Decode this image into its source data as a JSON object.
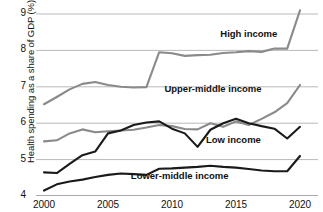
{
  "chart_data": {
    "type": "line",
    "title": "",
    "xlabel": "",
    "ylabel": "Health spending as a share of GDP (%)",
    "xlim": [
      2000,
      2020
    ],
    "ylim": [
      4,
      9
    ],
    "grid": true,
    "legend_position": "inline-labels",
    "x": [
      2000,
      2001,
      2002,
      2003,
      2004,
      2005,
      2006,
      2007,
      2008,
      2009,
      2010,
      2011,
      2012,
      2013,
      2014,
      2015,
      2016,
      2017,
      2018,
      2019,
      2020
    ],
    "xticks": [
      "2000",
      "2005",
      "2010",
      "2015",
      "2020"
    ],
    "yticks": [
      "4",
      "5",
      "6",
      "7",
      "8",
      "9"
    ],
    "series": [
      {
        "name": "High income",
        "color": "#8a8a8a",
        "label_x": 2016.0,
        "label_y": 8.45,
        "values": [
          6.52,
          6.72,
          6.93,
          7.08,
          7.13,
          7.05,
          7.0,
          6.98,
          6.99,
          7.95,
          7.92,
          7.85,
          7.87,
          7.88,
          7.93,
          7.95,
          7.98,
          7.96,
          8.05,
          8.05,
          9.1
        ]
      },
      {
        "name": "Upper-middle income",
        "color": "#8a8a8a",
        "label_x": 2013.2,
        "label_y": 6.95,
        "values": [
          5.5,
          5.53,
          5.72,
          5.83,
          5.75,
          5.78,
          5.8,
          5.82,
          5.88,
          5.95,
          5.92,
          5.84,
          5.83,
          6.0,
          5.9,
          6.05,
          5.95,
          6.12,
          6.3,
          6.55,
          7.05
        ]
      },
      {
        "name": "Low income",
        "color": "#1a1a1a",
        "label_x": 2014.8,
        "label_y": 5.55,
        "values": [
          4.65,
          4.63,
          4.88,
          5.12,
          5.22,
          5.72,
          5.8,
          5.95,
          6.02,
          6.05,
          5.85,
          5.72,
          5.35,
          5.82,
          6.0,
          6.12,
          6.0,
          5.92,
          5.85,
          5.58,
          5.9
        ]
      },
      {
        "name": "Lower-middle income",
        "color": "#1a1a1a",
        "label_x": 2010.6,
        "label_y": 4.55,
        "values": [
          4.15,
          4.32,
          4.4,
          4.45,
          4.52,
          4.58,
          4.62,
          4.6,
          4.58,
          4.75,
          4.76,
          4.78,
          4.8,
          4.83,
          4.8,
          4.78,
          4.74,
          4.7,
          4.68,
          4.68,
          5.1
        ]
      }
    ]
  }
}
